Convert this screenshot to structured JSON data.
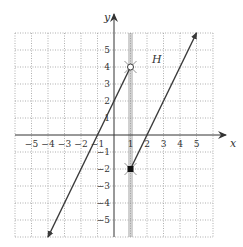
{
  "chart_data": {
    "type": "line",
    "title": "",
    "xlabel": "x",
    "ylabel": "y",
    "xlim": [
      -6,
      6
    ],
    "ylim": [
      -6,
      6
    ],
    "grid": true,
    "grid_style": "dotted",
    "x_ticks": [
      -5,
      -4,
      -3,
      -2,
      -1,
      1,
      2,
      3,
      4,
      5
    ],
    "y_ticks": [
      -5,
      -4,
      -3,
      -2,
      -1,
      1,
      2,
      3,
      4,
      5
    ],
    "x_tick_labels": [
      "−5",
      "−4",
      "−3",
      "−2",
      "−1",
      "1",
      "2",
      "3",
      "4",
      "5"
    ],
    "y_tick_labels": [
      "−5",
      "−4",
      "−3",
      "−2",
      "−1",
      "1",
      "2",
      "3",
      "4",
      "5"
    ],
    "series": [
      {
        "name": "left piece",
        "equation": "y = 2x + 2",
        "domain": "x < 1",
        "points": [
          [
            -4,
            -6
          ],
          [
            1,
            4
          ]
        ],
        "start_marker": "arrow",
        "end_marker": "open-circle",
        "end_point": [
          1,
          4
        ]
      },
      {
        "name": "right piece",
        "equation": "y = 2x - 4",
        "domain": "x >= 1",
        "points": [
          [
            1,
            -2
          ],
          [
            5,
            6
          ]
        ],
        "start_marker": "closed-square",
        "start_point": [
          1,
          -2
        ],
        "end_marker": "arrow"
      }
    ],
    "annotations": [
      {
        "text": "H",
        "x": 2.3,
        "y": 4.5,
        "style": "italic"
      },
      {
        "type": "vertical-band",
        "x": 1,
        "color": "#c8c8c8"
      }
    ]
  },
  "labels": {
    "x_axis": "x",
    "y_axis": "y",
    "annotation_H": "H"
  },
  "colors": {
    "line": "#3a3a3a",
    "grid": "#9a9a9a",
    "axis": "#333333",
    "band": "#d0d0d0"
  }
}
